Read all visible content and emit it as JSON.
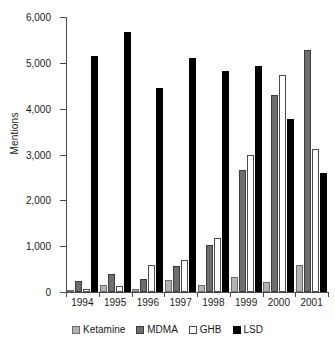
{
  "chart_data": {
    "type": "bar",
    "title": "",
    "xlabel": "",
    "ylabel": "Mentions",
    "ylim": [
      0,
      6000
    ],
    "ytick_labels": [
      "0",
      "1,000",
      "2,000",
      "3,000",
      "4,000",
      "5,000",
      "6,000"
    ],
    "ytick_values": [
      0,
      1000,
      2000,
      3000,
      4000,
      5000,
      6000
    ],
    "grid": false,
    "legend_position": "bottom",
    "categories": [
      "1994",
      "1995",
      "1996",
      "1997",
      "1998",
      "1999",
      "2000",
      "2001"
    ],
    "series": [
      {
        "name": "Ketamine",
        "color": "#b3b3b3",
        "values": [
          40,
          150,
          60,
          270,
          160,
          320,
          220,
          580
        ]
      },
      {
        "name": "MDMA",
        "color": "#6e6e6e",
        "values": [
          250,
          390,
          280,
          570,
          1030,
          2670,
          4290,
          5280
        ]
      },
      {
        "name": "GHB",
        "color": "#ffffff",
        "values": [
          60,
          130,
          580,
          690,
          1180,
          2990,
          4730,
          3110
        ]
      },
      {
        "name": "LSD",
        "color": "#000000",
        "values": [
          5150,
          5670,
          4450,
          5100,
          4820,
          4930,
          3780,
          2590
        ]
      }
    ]
  }
}
